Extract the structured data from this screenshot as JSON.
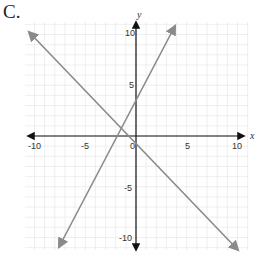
{
  "problem_label": "C.",
  "chart_data": {
    "type": "line",
    "title": "",
    "xlabel": "x",
    "ylabel": "y",
    "xlim": [
      -10,
      10
    ],
    "ylim": [
      -10,
      10
    ],
    "grid": true,
    "x_ticks": [
      "-10",
      "-5",
      "0",
      "5",
      "10"
    ],
    "y_ticks": [
      "10",
      "5",
      "-5",
      "-10"
    ],
    "series": [
      {
        "name": "line 1",
        "equation": "y = 2x + 4",
        "slope": 2,
        "intercept": 4,
        "x": [
          -7.5,
          3.5
        ],
        "y": [
          -11,
          11
        ],
        "color": "#8a8a8a"
      },
      {
        "name": "line 2",
        "equation": "y = -x - 1",
        "slope": -1,
        "intercept": -1,
        "x": [
          -10.5,
          10.2
        ],
        "y": [
          9.5,
          -11.2
        ],
        "color": "#8a8a8a"
      }
    ],
    "intersection": {
      "x": -1.67,
      "y": 0.67
    }
  }
}
